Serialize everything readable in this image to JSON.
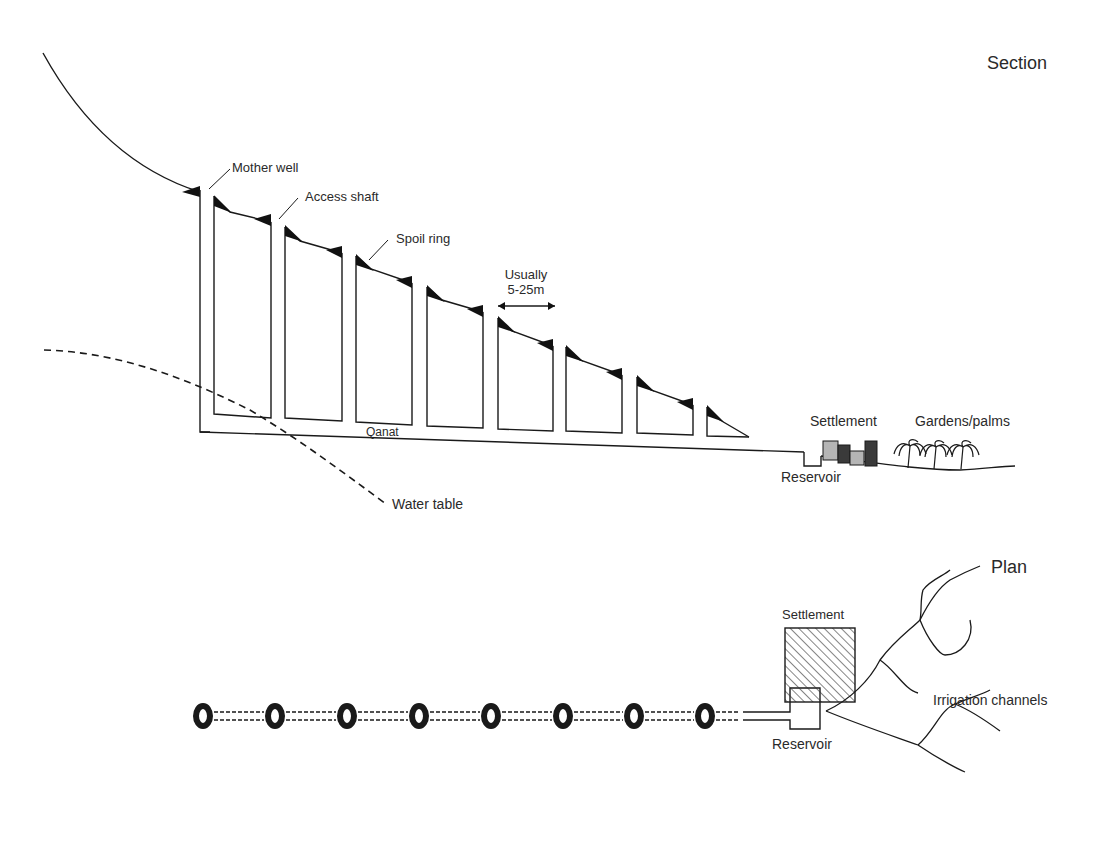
{
  "section": {
    "title": "Section",
    "labels": {
      "mother_well": "Mother well",
      "access_shaft": "Access shaft",
      "spoil_ring": "Spoil ring",
      "spacing_line1": "Usually",
      "spacing_line2": "5-25m",
      "qanat": "Qanat",
      "water_table": "Water table",
      "reservoir": "Reservoir",
      "settlement": "Settlement",
      "gardens": "Gardens/palms"
    }
  },
  "plan": {
    "title": "Plan",
    "well_count": 8,
    "labels": {
      "settlement": "Settlement",
      "irrigation": "Irrigation channels",
      "reservoir": "Reservoir"
    }
  },
  "colors": {
    "ink": "#1a1a1a",
    "building_light": "#b5b5b5",
    "building_dark": "#3a3a3a"
  }
}
